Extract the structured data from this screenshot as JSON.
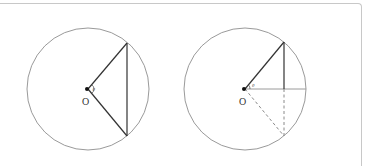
{
  "figure": {
    "left_panel": {
      "center_label": "O",
      "angle_label": "θ",
      "description": "Circle with isosceles triangle from center O to a vertical chord; angle θ at O"
    },
    "right_panel": {
      "center_label": "O",
      "angle_label": "θ",
      "description": "Circle with radius at angle θ, vertical drop to horizontal radius; dashed reflection below"
    }
  },
  "colors": {
    "circle": "#9a9a9a",
    "solid_line": "#333333",
    "dashed_line": "#8a8a8a",
    "frame": "#c8c8c8"
  }
}
